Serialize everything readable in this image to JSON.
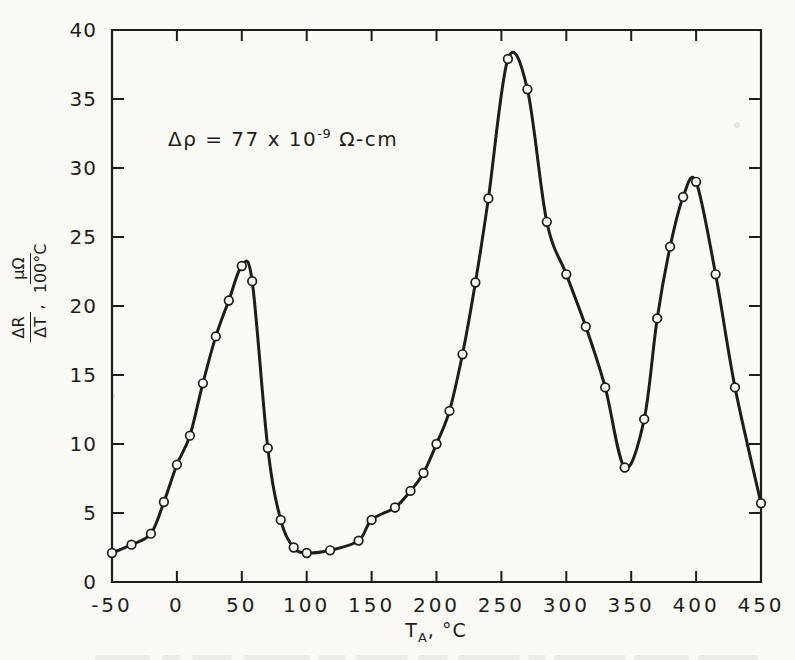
{
  "figure": {
    "paper_color": "#fbfaf7",
    "ink_color": "#1f1d1b"
  },
  "chart_data": {
    "type": "line",
    "title": "",
    "xlabel": "T_A, °C",
    "ylabel": "ΔR/ΔT, μΩ/100°C",
    "xlabel_parts": {
      "base": "T",
      "sub": "A",
      "suffix": ", °C"
    },
    "ylabel_parts": {
      "num1": "ΔR",
      "den1": "ΔT",
      "sep": ",",
      "num2": "μΩ",
      "den2": "100°C"
    },
    "annotation_text": "Δρ = 77 x 10⁻⁹ Ω-cm",
    "annotation": {
      "prefix": "Δρ = 77 x 10",
      "exponent": "-9",
      "suffix": " Ω-cm"
    },
    "xlim": [
      -50,
      450
    ],
    "ylim": [
      0,
      40
    ],
    "x_ticks": [
      -50,
      0,
      50,
      100,
      150,
      200,
      250,
      300,
      350,
      400,
      450
    ],
    "y_ticks": [
      0,
      5,
      10,
      15,
      20,
      25,
      30,
      35,
      40
    ],
    "grid": false,
    "legend": "none",
    "marker": "open-circle",
    "series": [
      {
        "name": "ΔR/ΔT vs annealing temperature",
        "points": [
          [
            -50,
            2.1
          ],
          [
            -35,
            2.7
          ],
          [
            -20,
            3.5
          ],
          [
            -10,
            5.8
          ],
          [
            0,
            8.5
          ],
          [
            10,
            10.6
          ],
          [
            20,
            14.4
          ],
          [
            30,
            17.8
          ],
          [
            40,
            20.4
          ],
          [
            50,
            22.9
          ],
          [
            58,
            21.8
          ],
          [
            70,
            9.7
          ],
          [
            80,
            4.5
          ],
          [
            90,
            2.5
          ],
          [
            100,
            2.1
          ],
          [
            118,
            2.3
          ],
          [
            140,
            3.0
          ],
          [
            150,
            4.5
          ],
          [
            168,
            5.4
          ],
          [
            180,
            6.6
          ],
          [
            190,
            7.9
          ],
          [
            200,
            10.0
          ],
          [
            210,
            12.4
          ],
          [
            220,
            16.5
          ],
          [
            230,
            21.7
          ],
          [
            240,
            27.8
          ],
          [
            255,
            37.9
          ],
          [
            270,
            35.7
          ],
          [
            285,
            26.1
          ],
          [
            300,
            22.3
          ],
          [
            315,
            18.5
          ],
          [
            330,
            14.1
          ],
          [
            345,
            8.3
          ],
          [
            360,
            11.8
          ],
          [
            370,
            19.1
          ],
          [
            380,
            24.3
          ],
          [
            390,
            27.9
          ],
          [
            400,
            29.0
          ],
          [
            415,
            22.3
          ],
          [
            430,
            14.1
          ],
          [
            450,
            5.7
          ]
        ]
      }
    ]
  }
}
